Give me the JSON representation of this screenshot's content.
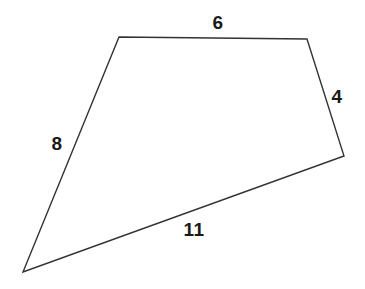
{
  "figure": {
    "name": "quadrilateral-with-side-lengths",
    "background_color": "#ffffff",
    "stroke_color": "#333333",
    "stroke_width": 1.4,
    "label_color": "#1a1a1a",
    "canvas": {
      "width": 365,
      "height": 289
    },
    "vertices": [
      {
        "name": "top-left",
        "x": 119,
        "y": 37
      },
      {
        "name": "top-right",
        "x": 307,
        "y": 39
      },
      {
        "name": "right",
        "x": 344,
        "y": 156
      },
      {
        "name": "bottom-left",
        "x": 23,
        "y": 272
      }
    ],
    "polygon_points": "119,37 307,39 344,156 23,272",
    "edges": [
      {
        "name": "top-edge",
        "from": "top-left",
        "to": "top-right",
        "label": "6",
        "label_x": 218,
        "label_y": 22
      },
      {
        "name": "right-edge",
        "from": "top-right",
        "to": "right",
        "label": "4",
        "label_x": 337,
        "label_y": 96
      },
      {
        "name": "bottom-edge",
        "from": "right",
        "to": "bottom-left",
        "label": "11",
        "label_x": 194,
        "label_y": 229
      },
      {
        "name": "left-edge",
        "from": "bottom-left",
        "to": "top-left",
        "label": "8",
        "label_x": 57,
        "label_y": 143
      }
    ]
  }
}
